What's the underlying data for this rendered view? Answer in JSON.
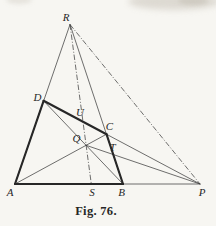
{
  "caption": "Fig. 76.",
  "colors": {
    "paper": "#f7f6f2",
    "ink": "#3f3f3f",
    "ink_bold": "#272727"
  },
  "figure": {
    "width": 216,
    "height": 226,
    "points": {
      "A": {
        "x": 15,
        "y": 184,
        "label": {
          "x": 10,
          "y": 196
        }
      },
      "B": {
        "x": 123,
        "y": 184,
        "label": {
          "x": 121.5,
          "y": 196
        }
      },
      "P": {
        "x": 200,
        "y": 184,
        "label": {
          "x": 202,
          "y": 196
        }
      },
      "R": {
        "x": 70,
        "y": 24.5,
        "label": {
          "x": 66,
          "y": 21
        }
      },
      "S": {
        "x": 91.3,
        "y": 184,
        "label": {
          "x": 92,
          "y": 196
        }
      },
      "D": {
        "x": 43.6,
        "y": 100.8,
        "label": {
          "x": 37.5,
          "y": 100.5
        }
      },
      "C": {
        "x": 106.5,
        "y": 134.2,
        "label": {
          "x": 109.5,
          "y": 130
        }
      },
      "Q": {
        "x": 86.1,
        "y": 145.3,
        "label": {
          "x": 76.5,
          "y": 142
        }
      },
      "U": {
        "x": 83.0,
        "y": 121.7,
        "label": {
          "x": 80,
          "y": 116
        }
      },
      "T": {
        "x": 113.2,
        "y": 154.5,
        "label": {
          "x": 112.5,
          "y": 150.5
        }
      }
    },
    "edges": [
      {
        "from": "A",
        "to": "P",
        "style": "thin"
      },
      {
        "from": "A",
        "to": "R",
        "style": "thin"
      },
      {
        "from": "R",
        "to": "B",
        "style": "thin"
      },
      {
        "from": "D",
        "to": "P",
        "style": "thin"
      },
      {
        "from": "A",
        "to": "C",
        "style": "thin"
      },
      {
        "from": "B",
        "to": "D",
        "style": "thin"
      },
      {
        "from": "Q",
        "to": "P",
        "style": "thin"
      },
      {
        "from": "R",
        "to": "P",
        "style": "dashdot"
      },
      {
        "from": "R",
        "to": "S",
        "style": "dashdot"
      },
      {
        "from": "A",
        "to": "B",
        "style": "thick"
      },
      {
        "from": "A",
        "to": "D",
        "style": "thick"
      },
      {
        "from": "D",
        "to": "C",
        "style": "thick"
      },
      {
        "from": "C",
        "to": "B",
        "style": "thick"
      }
    ]
  }
}
